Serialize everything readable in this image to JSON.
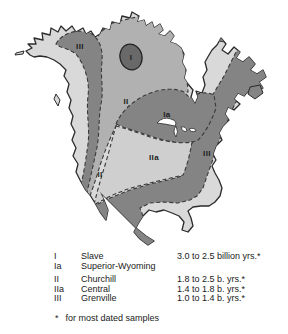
{
  "map": {
    "region_labels": [
      {
        "text": "III"
      },
      {
        "text": "I"
      },
      {
        "text": "II"
      },
      {
        "text": "Ia"
      },
      {
        "text": "IIa"
      },
      {
        "text": "II"
      },
      {
        "text": "III"
      }
    ],
    "colors": {
      "background": "#ffffff",
      "land_light": "#d9d9d9",
      "churchill": "#b1b1b1",
      "central": "#cfcfcf",
      "dark_province": "#848484",
      "slave": "#696969",
      "water": "#ffffff",
      "outline": "#2b2b2b"
    }
  },
  "legend": {
    "entries": [
      {
        "numeral": "I",
        "name": "Slave",
        "age": "3.0 to 2.5 billion yrs.*"
      },
      {
        "numeral": "Ia",
        "name": "Superior-Wyoming",
        "age": ""
      },
      {
        "numeral": "II",
        "name": "Churchill",
        "age": "1.8 to 2.5 b. yrs.*"
      },
      {
        "numeral": "IIa",
        "name": "Central",
        "age": "1.4 to 1.8 b. yrs.*"
      },
      {
        "numeral": "III",
        "name": "Grenville",
        "age": "1.0 to 1.4 b. yrs.*"
      }
    ],
    "footnote": {
      "marker": "*",
      "text": "for most dated samples"
    }
  }
}
